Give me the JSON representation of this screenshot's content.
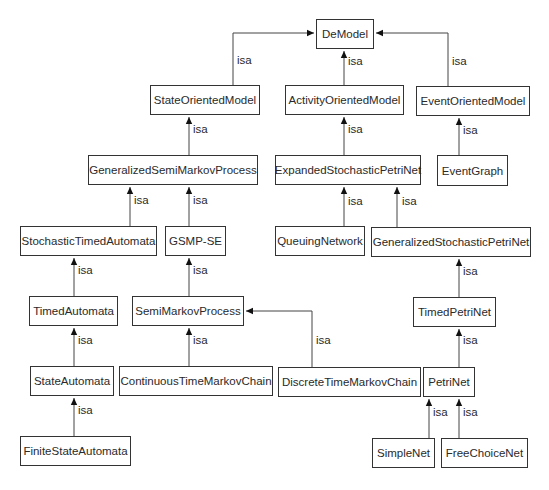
{
  "diagram": {
    "type": "class-hierarchy",
    "relation_label": "isa",
    "nodes": [
      {
        "id": "DeModel",
        "label": "DeModel",
        "x": 316,
        "y": 19,
        "w": 58,
        "h": 30
      },
      {
        "id": "StateOrientedModel",
        "label": "StateOrientedModel",
        "x": 150,
        "y": 85,
        "w": 110,
        "h": 30
      },
      {
        "id": "ActivityOrientedModel",
        "label": "ActivityOrientedModel",
        "x": 285,
        "y": 85,
        "w": 119,
        "h": 30
      },
      {
        "id": "EventOrientedModel",
        "label": "EventOrientedModel",
        "x": 416,
        "y": 86,
        "w": 114,
        "h": 30
      },
      {
        "id": "GeneralizedSemiMarkovProcess",
        "label": "GeneralizedSemiMarkovProcess",
        "x": 88,
        "y": 155,
        "w": 170,
        "h": 30
      },
      {
        "id": "ExpandedStochasticPetriNet",
        "label": "ExpandedStochasticPetriNet",
        "x": 275,
        "y": 155,
        "w": 146,
        "h": 30
      },
      {
        "id": "EventGraph",
        "label": "EventGraph",
        "x": 437,
        "y": 155,
        "w": 71,
        "h": 31
      },
      {
        "id": "StochasticTimedAutomata",
        "label": "StochasticTimedAutomata",
        "x": 20,
        "y": 226,
        "w": 137,
        "h": 30
      },
      {
        "id": "GSMP-SE",
        "label": "GSMP-SE",
        "x": 165,
        "y": 226,
        "w": 61,
        "h": 30
      },
      {
        "id": "QueuingNetwork",
        "label": "QueuingNetwork",
        "x": 275,
        "y": 226,
        "w": 90,
        "h": 30
      },
      {
        "id": "GeneralizedStochasticPetriNet",
        "label": "GeneralizedStochasticPetriNet",
        "x": 371,
        "y": 227,
        "w": 160,
        "h": 30
      },
      {
        "id": "TimedAutomata",
        "label": "TimedAutomata",
        "x": 29,
        "y": 296,
        "w": 89,
        "h": 30
      },
      {
        "id": "SemiMarkovProcess",
        "label": "SemiMarkovProcess",
        "x": 132,
        "y": 296,
        "w": 112,
        "h": 30
      },
      {
        "id": "TimedPetriNet",
        "label": "TimedPetriNet",
        "x": 413,
        "y": 297,
        "w": 83,
        "h": 30
      },
      {
        "id": "StateAutomata",
        "label": "StateAutomata",
        "x": 30,
        "y": 366,
        "w": 84,
        "h": 30
      },
      {
        "id": "ContinuousTimeMarkovChain",
        "label": "ContinuousTimeMarkovChain",
        "x": 119,
        "y": 366,
        "w": 154,
        "h": 30
      },
      {
        "id": "DiscreteTimeMarkovChain",
        "label": "DiscreteTimeMarkovChain",
        "x": 278,
        "y": 367,
        "w": 143,
        "h": 30
      },
      {
        "id": "PetriNet",
        "label": "PetriNet",
        "x": 423,
        "y": 367,
        "w": 52,
        "h": 30
      },
      {
        "id": "FiniteStateAutomata",
        "label": "FiniteStateAutomata",
        "x": 20,
        "y": 436,
        "w": 111,
        "h": 30
      },
      {
        "id": "SimpleNet",
        "label": "SimpleNet",
        "x": 372,
        "y": 438,
        "w": 63,
        "h": 30
      },
      {
        "id": "FreeChoiceNet",
        "label": "FreeChoiceNet",
        "x": 441,
        "y": 438,
        "w": 87,
        "h": 30
      }
    ],
    "edges": [
      {
        "from": "StateOrientedModel",
        "to": "DeModel",
        "label": "isa",
        "points": [
          [
            233,
            85
          ],
          [
            233,
            33
          ],
          [
            314,
            33
          ]
        ],
        "label_pos": [
          237,
          61
        ]
      },
      {
        "from": "ActivityOrientedModel",
        "to": "DeModel",
        "label": "isa",
        "points": [
          [
            344,
            85
          ],
          [
            344,
            51
          ]
        ],
        "label_pos": [
          348,
          62
        ]
      },
      {
        "from": "EventOrientedModel",
        "to": "DeModel",
        "label": "isa",
        "points": [
          [
            448,
            86
          ],
          [
            448,
            33
          ],
          [
            376,
            33
          ]
        ],
        "label_pos": [
          452,
          62
        ]
      },
      {
        "from": "GeneralizedSemiMarkovProcess",
        "to": "StateOrientedModel",
        "label": "isa",
        "points": [
          [
            189,
            155
          ],
          [
            189,
            117
          ]
        ],
        "label_pos": [
          193,
          130
        ]
      },
      {
        "from": "ExpandedStochasticPetriNet",
        "to": "ActivityOrientedModel",
        "label": "isa",
        "points": [
          [
            344,
            155
          ],
          [
            344,
            117
          ]
        ],
        "label_pos": [
          348,
          130
        ]
      },
      {
        "from": "EventGraph",
        "to": "EventOrientedModel",
        "label": "isa",
        "points": [
          [
            459,
            155
          ],
          [
            459,
            118
          ]
        ],
        "label_pos": [
          463,
          131
        ]
      },
      {
        "from": "StochasticTimedAutomata",
        "to": "GeneralizedSemiMarkovProcess",
        "label": "isa",
        "points": [
          [
            130,
            226
          ],
          [
            130,
            187
          ]
        ],
        "label_pos": [
          134,
          201
        ]
      },
      {
        "from": "GSMP-SE",
        "to": "GeneralizedSemiMarkovProcess",
        "label": "isa",
        "points": [
          [
            189,
            226
          ],
          [
            189,
            187
          ]
        ],
        "label_pos": [
          193,
          201
        ]
      },
      {
        "from": "QueuingNetwork",
        "to": "ExpandedStochasticPetriNet",
        "label": "isa",
        "points": [
          [
            344,
            226
          ],
          [
            344,
            187
          ]
        ],
        "label_pos": [
          348,
          202
        ]
      },
      {
        "from": "GeneralizedStochasticPetriNet",
        "to": "ExpandedStochasticPetriNet",
        "label": "isa",
        "points": [
          [
            397,
            227
          ],
          [
            397,
            187
          ]
        ],
        "label_pos": [
          402,
          202
        ]
      },
      {
        "from": "TimedAutomata",
        "to": "StochasticTimedAutomata",
        "label": "isa",
        "points": [
          [
            74,
            296
          ],
          [
            74,
            258
          ]
        ],
        "label_pos": [
          78,
          271
        ]
      },
      {
        "from": "SemiMarkovProcess",
        "to": "GSMP-SE",
        "label": "isa",
        "points": [
          [
            189,
            296
          ],
          [
            189,
            258
          ]
        ],
        "label_pos": [
          193,
          271
        ]
      },
      {
        "from": "TimedPetriNet",
        "to": "GeneralizedStochasticPetriNet",
        "label": "isa",
        "points": [
          [
            459,
            297
          ],
          [
            459,
            259
          ]
        ],
        "label_pos": [
          463,
          272
        ]
      },
      {
        "from": "StateAutomata",
        "to": "TimedAutomata",
        "label": "isa",
        "points": [
          [
            74,
            366
          ],
          [
            74,
            328
          ]
        ],
        "label_pos": [
          78,
          341
        ]
      },
      {
        "from": "ContinuousTimeMarkovChain",
        "to": "SemiMarkovProcess",
        "label": "isa",
        "points": [
          [
            189,
            366
          ],
          [
            189,
            328
          ]
        ],
        "label_pos": [
          193,
          341
        ]
      },
      {
        "from": "DiscreteTimeMarkovChain",
        "to": "SemiMarkovProcess",
        "label": "isa",
        "points": [
          [
            312,
            367
          ],
          [
            312,
            311
          ],
          [
            246,
            311
          ]
        ],
        "label_pos": [
          316,
          341
        ]
      },
      {
        "from": "PetriNet",
        "to": "TimedPetriNet",
        "label": "isa",
        "points": [
          [
            459,
            367
          ],
          [
            459,
            329
          ]
        ],
        "label_pos": [
          463,
          341
        ]
      },
      {
        "from": "FiniteStateAutomata",
        "to": "StateAutomata",
        "label": "isa",
        "points": [
          [
            74,
            436
          ],
          [
            74,
            398
          ]
        ],
        "label_pos": [
          78,
          411
        ]
      },
      {
        "from": "SimpleNet",
        "to": "PetriNet",
        "label": "isa",
        "points": [
          [
            429,
            438
          ],
          [
            429,
            399
          ]
        ],
        "label_pos": [
          433,
          413
        ]
      },
      {
        "from": "FreeChoiceNet",
        "to": "PetriNet",
        "label": "isa",
        "points": [
          [
            459,
            438
          ],
          [
            459,
            399
          ]
        ],
        "label_pos": [
          463,
          413
        ]
      }
    ]
  }
}
